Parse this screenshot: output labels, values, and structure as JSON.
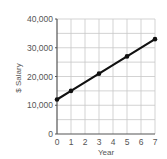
{
  "chart_data": {
    "type": "line",
    "title": "",
    "xlabel": "Year",
    "ylabel": "$ Salary",
    "x": [
      0,
      1,
      3,
      5,
      7
    ],
    "series": [
      {
        "name": "Salary",
        "values": [
          12000,
          15000,
          21000,
          27000,
          33000
        ],
        "color": "#111111",
        "markers": true
      }
    ],
    "xlim": [
      0,
      7
    ],
    "ylim": [
      0,
      40000
    ],
    "xticks": [
      "0",
      "1",
      "2",
      "3",
      "4",
      "5",
      "6",
      "7"
    ],
    "yticks": [
      "0",
      "10,000",
      "20,000",
      "30,000",
      "40,000"
    ],
    "ytick_values": [
      0,
      10000,
      20000,
      30000,
      40000
    ],
    "grid": true,
    "grid_x_step": 1,
    "grid_y_step": 5000,
    "legend": null
  },
  "colors": {
    "line": "#111111",
    "grid": "#c8c8c8",
    "axis": "#555555",
    "text": "#555555",
    "background": "#ffffff"
  }
}
